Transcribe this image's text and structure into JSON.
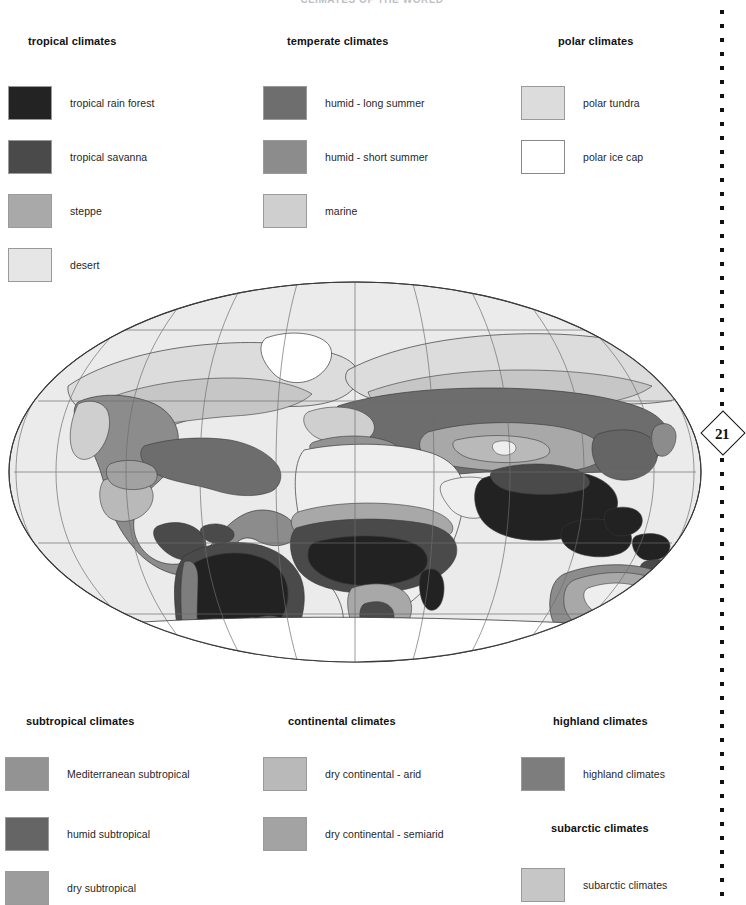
{
  "document": {
    "title": "CLIMATES OF THE WORLD",
    "page_number": "21"
  },
  "legend_top": [
    {
      "heading": "tropical climates",
      "heading_x": 28,
      "col_x": 8,
      "entries": [
        {
          "label": "tropical rain forest",
          "color": "#232323"
        },
        {
          "label": "tropical savanna",
          "color": "#4a4a4a"
        },
        {
          "label": "steppe",
          "color": "#a9a9a9"
        },
        {
          "label": "desert",
          "color": "#e6e6e6"
        }
      ]
    },
    {
      "heading": "temperate climates",
      "heading_x": 287,
      "col_x": 263,
      "entries": [
        {
          "label": "humid - long summer",
          "color": "#6e6e6e"
        },
        {
          "label": "humid - short summer",
          "color": "#8c8c8c"
        },
        {
          "label": "marine",
          "color": "#cfcfcf"
        }
      ]
    },
    {
      "heading": "polar climates",
      "heading_x": 558,
      "col_x": 521,
      "entries": [
        {
          "label": "polar tundra",
          "color": "#dcdcdc"
        },
        {
          "label": "polar ice cap",
          "color": "#ffffff"
        }
      ]
    }
  ],
  "legend_bottom": [
    {
      "heading": "subtropical climates",
      "heading_x": 26,
      "col_x": 5,
      "heading_y": 715,
      "entries": [
        {
          "label": "Mediterranean subtropical",
          "color": "#939393",
          "y": 757
        },
        {
          "label": "humid subtropical",
          "color": "#656565",
          "y": 817
        },
        {
          "label": "dry subtropical",
          "color": "#9c9c9c",
          "y": 871
        }
      ]
    },
    {
      "heading": "continental climates",
      "heading_x": 288,
      "col_x": 263,
      "heading_y": 715,
      "entries": [
        {
          "label": "dry continental - arid",
          "color": "#b9b9b9",
          "y": 757
        },
        {
          "label": "dry continental - semiarid",
          "color": "#a3a3a3",
          "y": 817
        }
      ]
    },
    {
      "heading": "highland climates",
      "heading_x": 553,
      "col_x": 521,
      "heading_y": 715,
      "entries": [
        {
          "label": "highland climates",
          "color": "#7d7d7d",
          "y": 757
        }
      ]
    },
    {
      "heading": "subarctic climates",
      "heading_x": 551,
      "col_x": 521,
      "heading_y": 822,
      "entries": [
        {
          "label": "subarctic climates",
          "color": "#c6c6c6",
          "y": 868
        }
      ]
    }
  ],
  "map": {
    "projection": "elliptical world projection",
    "ocean_color": "#ebebeb",
    "graticule_color": "#6d6d6d",
    "outline_color": "#3a3a3a",
    "ice_color": "#ffffff",
    "tundra_color": "#dcdcdc",
    "subarctic_color": "#c6c6c6",
    "rainforest_color": "#232323",
    "savanna_color": "#4a4a4a",
    "steppe_color": "#a9a9a9",
    "desert_color": "#eeeeee",
    "humid_long_color": "#6e6e6e",
    "humid_short_color": "#8c8c8c",
    "marine_color": "#cfcfcf",
    "highland_color": "#7d7d7d",
    "med_color": "#939393"
  }
}
